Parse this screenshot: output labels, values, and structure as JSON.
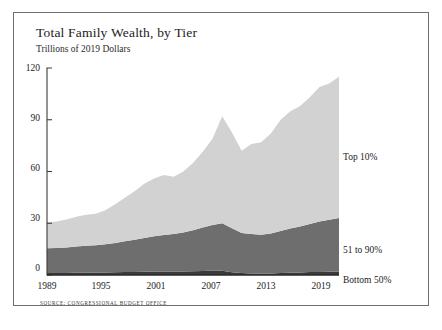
{
  "chart_data": {
    "type": "area",
    "stacked": true,
    "title": "Total Family Wealth, by Tier",
    "subtitle": "Trillions of 2019 Dollars",
    "xlabel": "",
    "ylabel": "",
    "ylim": [
      0,
      120
    ],
    "xlim": [
      1989,
      2019
    ],
    "grid": false,
    "legend_position": "right-inline",
    "yticks": [
      0,
      30,
      60,
      90,
      120
    ],
    "ytick_labels": [
      "0",
      "30",
      "60",
      "90",
      "120"
    ],
    "xticks": [
      1989,
      1995,
      2001,
      2007,
      2013,
      2019
    ],
    "xtick_labels": [
      "1989",
      "1995",
      "2001",
      "2007",
      "2013",
      "2019"
    ],
    "x": [
      1989,
      1990,
      1991,
      1992,
      1993,
      1994,
      1995,
      1996,
      1997,
      1998,
      1999,
      2000,
      2001,
      2002,
      2003,
      2004,
      2005,
      2006,
      2007,
      2008,
      2009,
      2010,
      2011,
      2012,
      2013,
      2014,
      2015,
      2016,
      2017,
      2018,
      2019
    ],
    "series": [
      {
        "name": "Bottom 50%",
        "color": "#3a3a3a",
        "values": [
          1.2,
          1.2,
          1.2,
          1.3,
          1.3,
          1.4,
          1.5,
          1.6,
          1.7,
          1.8,
          1.9,
          2.0,
          2.0,
          2.0,
          2.1,
          2.2,
          2.3,
          2.4,
          2.4,
          1.6,
          1.1,
          0.9,
          0.8,
          0.9,
          1.1,
          1.3,
          1.5,
          1.7,
          1.8,
          1.9,
          2.0
        ]
      },
      {
        "name": "51 to 90%",
        "color": "#6e6e6e",
        "values": [
          14.3,
          14.5,
          14.8,
          15.2,
          15.6,
          15.8,
          16.3,
          17.0,
          17.8,
          18.6,
          19.6,
          20.5,
          21.2,
          21.8,
          22.6,
          23.8,
          25.2,
          26.6,
          27.6,
          25.5,
          23.2,
          22.8,
          22.6,
          23.2,
          24.4,
          25.6,
          26.6,
          27.8,
          29.2,
          30.2,
          31.0
        ]
      },
      {
        "name": "Top 10%",
        "color": "#d2d2d2",
        "values": [
          15.0,
          15.3,
          16.2,
          17.3,
          18.1,
          18.3,
          19.7,
          22.4,
          25.3,
          28.1,
          31.4,
          33.5,
          34.8,
          33.2,
          35.3,
          39.0,
          44.0,
          50.0,
          62.0,
          55.5,
          47.7,
          52.3,
          53.6,
          57.9,
          64.5,
          68.1,
          69.9,
          73.5,
          78.0,
          78.9,
          82.0
        ]
      }
    ],
    "totals": {
      "1989": 30.5,
      "1995": 37.5,
      "2001": 58.0,
      "2007": 92.0,
      "2013": 90.0,
      "2019": 115.0
    },
    "annotations": []
  },
  "source": {
    "note": "SOURCE: CONGRESSIONAL BUDGET OFFICE"
  },
  "legend": {
    "items": [
      {
        "label": "Top 10%",
        "color": "#d2d2d2"
      },
      {
        "label": "51 to 90%",
        "color": "#6e6e6e"
      },
      {
        "label": "Bottom 50%",
        "color": "#3a3a3a"
      }
    ]
  }
}
